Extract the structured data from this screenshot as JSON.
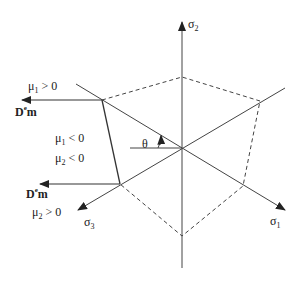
{
  "diagram": {
    "type": "deviatoric-plane-yield-surface",
    "axes": {
      "sigma1": {
        "symbol": "σ",
        "sub": "1"
      },
      "sigma2": {
        "symbol": "σ",
        "sub": "2"
      },
      "sigma3": {
        "symbol": "σ",
        "sub": "3"
      }
    },
    "angle_label": "θ",
    "upper_arrow": {
      "label_main": "D",
      "label_sup": "e",
      "label_tail": "m",
      "condition": {
        "symbol": "μ",
        "sub": "1",
        "rel": " > 0"
      }
    },
    "middle_conditions": [
      {
        "symbol": "μ",
        "sub": "1",
        "rel": " < 0"
      },
      {
        "symbol": "μ",
        "sub": "2",
        "rel": " < 0"
      }
    ],
    "lower_arrow": {
      "label_main": "D",
      "label_sup": "e",
      "label_tail": "m",
      "condition": {
        "symbol": "μ",
        "sub": "2",
        "rel": " > 0"
      }
    },
    "colors": {
      "line": "#333333",
      "background": "#ffffff"
    }
  }
}
